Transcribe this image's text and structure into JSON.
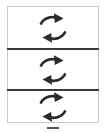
{
  "panel": {
    "name": "refresh-icon-stack",
    "background_color": "#ffffff",
    "border_color": "#c9c9c9",
    "divider_color": "#3a3a3a",
    "icon_color": "#2b2b2b"
  },
  "cells": [
    {
      "id": "cell-1",
      "icon": "refresh-circular-arrows-icon",
      "label": ""
    },
    {
      "id": "cell-2",
      "icon": "refresh-circular-arrows-icon",
      "label": ""
    },
    {
      "id": "cell-3",
      "icon": "refresh-circular-arrows-icon",
      "label": ""
    }
  ],
  "dividers": [
    {
      "id": "divider-1"
    },
    {
      "id": "divider-2"
    }
  ],
  "footer": {
    "dash_marker": "",
    "dash_color": "#555555"
  }
}
